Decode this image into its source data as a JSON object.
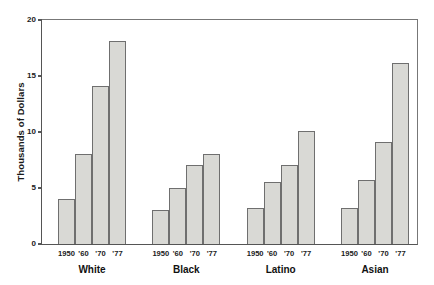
{
  "chart_data": {
    "type": "bar",
    "title": "",
    "subtitle": "",
    "xlabel": "",
    "ylabel": "Thousands of Dollars",
    "ylim": [
      0,
      20
    ],
    "yticks": [
      0,
      5,
      10,
      15,
      20
    ],
    "ytick_labels": [
      "0",
      "5",
      "10",
      "15",
      "20"
    ],
    "grid": false,
    "legend": "none",
    "grouped": true,
    "group_labels": [
      "White",
      "Black",
      "Latino",
      "Asian"
    ],
    "categories": [
      "1950",
      "'60",
      "'70",
      "'77"
    ],
    "series": [
      {
        "name": "White",
        "values": [
          4,
          8,
          14,
          18
        ]
      },
      {
        "name": "Black",
        "values": [
          3,
          5,
          7,
          8
        ]
      },
      {
        "name": "Latino",
        "values": [
          3.2,
          5.5,
          7,
          10
        ]
      },
      {
        "name": "Asian",
        "values": [
          3.2,
          5.7,
          9,
          16
        ]
      }
    ],
    "bar_fill_color": "#d9d9d5",
    "bar_edge_color": "#6f6f6f",
    "axis_color": "#555555",
    "background_color": "#ffffff"
  }
}
